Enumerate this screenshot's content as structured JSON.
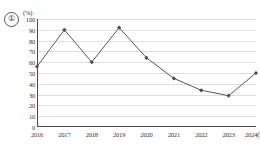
{
  "figure": {
    "marker_label": "①",
    "unit_label": "(%)"
  },
  "chart_data": {
    "type": "line",
    "title": "",
    "subtitle": "",
    "xlabel": "",
    "ylabel": "",
    "unit": "(%)",
    "categories": [
      "2016",
      "2017",
      "2018",
      "2019",
      "2020",
      "2021",
      "2022",
      "2023",
      "2024"
    ],
    "x_tick_labels": [
      "2016",
      "2017",
      "2018",
      "2019",
      "2020",
      "2021",
      "2022",
      "2023",
      "2024(년)"
    ],
    "x_axis_suffix": "(년)",
    "series": [
      {
        "name": "",
        "values": [
          56,
          90,
          60,
          92,
          64,
          45,
          34,
          29,
          50
        ],
        "color": "#5a5a5a",
        "marker": "diamond",
        "marker_color": "#4a4a4a"
      }
    ],
    "ylim": [
      0,
      100
    ],
    "y_tick_step": 10,
    "y_tick_labels": [
      "0",
      "10",
      "20",
      "30",
      "40",
      "50",
      "60",
      "70",
      "80",
      "90",
      "100"
    ],
    "grid": true,
    "grid_axis": "y",
    "grid_color": "#dedede",
    "axis_color": "#4a4a4a",
    "legend": false,
    "legend_position": "none",
    "background": "#ffffff"
  }
}
